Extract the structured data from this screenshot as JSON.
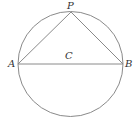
{
  "diagram": {
    "type": "circle-inscribed-triangle",
    "stroke_color": "#8a8a8a",
    "label_color": "#333333",
    "circle": {
      "cx": 70.5,
      "cy": 64,
      "r": 52.5
    },
    "points": {
      "A": {
        "x": 18,
        "y": 64,
        "label": "A"
      },
      "B": {
        "x": 123,
        "y": 64,
        "label": "B"
      },
      "P": {
        "x": 71,
        "y": 12,
        "label": "P"
      },
      "C": {
        "x": 70.5,
        "y": 64,
        "label": "C"
      }
    },
    "segments": [
      {
        "from": "A",
        "to": "B",
        "name": "diameter-AB"
      },
      {
        "from": "A",
        "to": "P",
        "name": "chord-AP"
      },
      {
        "from": "P",
        "to": "B",
        "name": "chord-PB"
      }
    ]
  }
}
